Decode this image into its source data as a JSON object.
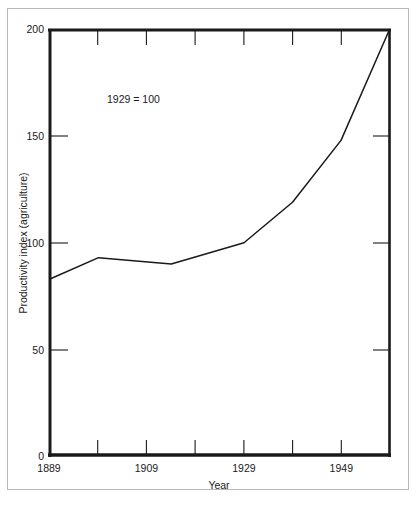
{
  "figure": {
    "background_color": "#ffffff",
    "border_color": "#b9b9b9",
    "ink_color": "#1a1a1a"
  },
  "chart_data": {
    "type": "line",
    "title": "",
    "subtitle": "",
    "annotation": "1929 = 100",
    "xlabel": "Year",
    "ylabel": "Productivity index (agriculture)",
    "xlim": [
      1889,
      1959
    ],
    "ylim": [
      0,
      200
    ],
    "grid": false,
    "legend": "none",
    "line_color": "#1a1a1a",
    "x_ticks_major": [
      1889,
      1909,
      1929,
      1949
    ],
    "x_tick_labels": [
      "1889",
      "1909",
      "1929",
      "1949"
    ],
    "x_ticks_minor": [
      1899,
      1919,
      1939,
      1949,
      1959
    ],
    "y_ticks": [
      0,
      50,
      100,
      150,
      200
    ],
    "y_tick_labels": [
      "0",
      "50",
      "100",
      "150",
      "200"
    ],
    "x": [
      1889,
      1899,
      1914,
      1929,
      1939,
      1949,
      1959
    ],
    "values": [
      83,
      93,
      90,
      100,
      119,
      148,
      200
    ],
    "series": [
      {
        "name": "Productivity index (agriculture)",
        "x": [
          1889,
          1899,
          1914,
          1929,
          1939,
          1949,
          1959
        ],
        "values": [
          83,
          93,
          90,
          100,
          119,
          148,
          200
        ]
      }
    ]
  }
}
